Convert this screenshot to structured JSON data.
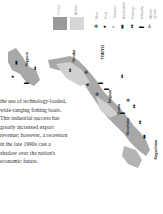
{
  "paragraph": {
    "lines": [
      "the use of technology-loaded,",
      "wide-ranging fishing boats.",
      "This industrial success has",
      "greatly increased export",
      "revenue; however, a recession",
      "in the late 1990s cast a",
      "shadow over the nation's",
      "economic future."
    ]
  },
  "legend": {
    "swatches": [
      {
        "label": "Forest",
        "color": "#9a9a9a"
      },
      {
        "label": "Arable",
        "color": "#d6d6d6"
      }
    ],
    "icons": [
      {
        "label": "Rice",
        "glyph": "❉",
        "icon": "rice-icon"
      },
      {
        "label": "Fruit",
        "glyph": "●",
        "icon": "fruit-icon"
      },
      {
        "label": "Tobacco",
        "glyph": "ↄ",
        "icon": "tobacco-icon"
      },
      {
        "label": "Beef cattle",
        "glyph": "▮",
        "icon": "cattle-icon"
      },
      {
        "label": "Fishing",
        "glyph": "⬍",
        "icon": "fish-icon"
      },
      {
        "label": "Industry",
        "glyph": "▬",
        "icon": "industry-icon"
      },
      {
        "label": "Winter sports",
        "glyph": "⅄",
        "icon": "skier-icon"
      }
    ]
  },
  "map": {
    "land_color": "#a8a8a8",
    "cities": [
      {
        "name": "Sapporo"
      },
      {
        "name": "Sendai"
      },
      {
        "name": "TOKYO"
      },
      {
        "name": "Nagoya"
      },
      {
        "name": "Osaka"
      },
      {
        "name": "Hiroshima"
      },
      {
        "name": "Kagoshima"
      }
    ]
  }
}
